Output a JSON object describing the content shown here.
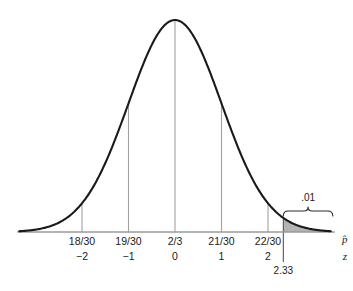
{
  "chart_data": {
    "type": "line",
    "title": "",
    "subtitle": "",
    "xlabel": "",
    "ylabel": "",
    "grid": false,
    "legend_position": "none",
    "curve": {
      "name": "normal-density",
      "distribution": "standard-normal",
      "mean": 0,
      "sd": 1,
      "xlim": [
        -3.35,
        3.35
      ],
      "ylim": [
        0,
        1
      ]
    },
    "axes": [
      {
        "name": "p-hat",
        "label": "p̂",
        "tick_labels": [
          "18/30",
          "19/30",
          "2/3",
          "21/30",
          "22/30"
        ]
      },
      {
        "name": "z",
        "label": "z",
        "tick_labels": [
          "−2",
          "−1",
          "0",
          "1",
          "2"
        ]
      }
    ],
    "ticks": [
      {
        "z": -2,
        "p_hat": "18/30",
        "z_label": "−2"
      },
      {
        "z": -1,
        "p_hat": "19/30",
        "z_label": "−1"
      },
      {
        "z": 0,
        "p_hat": "2/3",
        "z_label": "0"
      },
      {
        "z": 1,
        "p_hat": "21/30",
        "z_label": "1"
      },
      {
        "z": 2,
        "p_hat": "22/30",
        "z_label": "2"
      }
    ],
    "critical_value": {
      "z": 2.33,
      "label": "2.33"
    },
    "shaded_region": {
      "name": "upper-tail",
      "from_z": 2.33,
      "to_z": 3.35,
      "area": 0.01,
      "area_label": ".01",
      "fill_color": "#b3b3b3"
    },
    "annotations": [
      {
        "name": "tail-area-label",
        "text": ".01"
      }
    ]
  },
  "colors": {
    "background": "#ffffff",
    "curve": "#1a1a1a",
    "axis": "#9a9a9a",
    "tick": "#a2a2a2",
    "shade": "#b3b3b3",
    "text": "#1a1a1a"
  }
}
